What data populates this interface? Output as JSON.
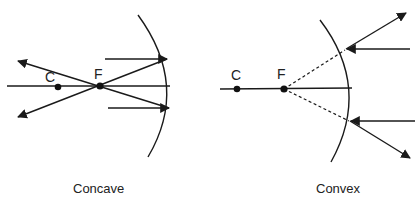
{
  "diagrams": {
    "concave": {
      "caption": "Concave",
      "points": {
        "center_label": "C",
        "focus_label": "F"
      }
    },
    "convex": {
      "caption": "Convex",
      "points": {
        "center_label": "C",
        "focus_label": "F"
      }
    }
  },
  "colors": {
    "ink": "#1a1a1a",
    "background": "#ffffff"
  }
}
